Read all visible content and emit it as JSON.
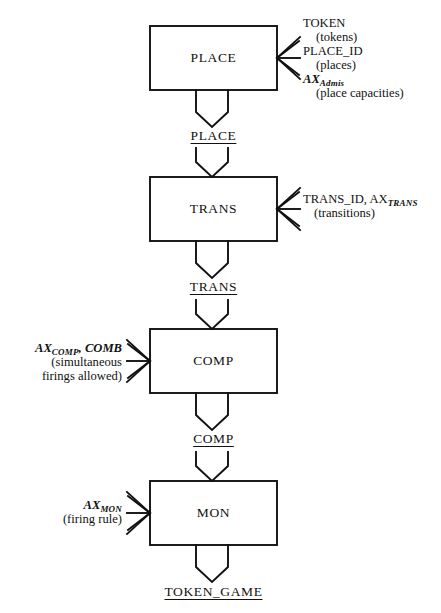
{
  "diagram": {
    "line_color": "#111111",
    "background_color": "#ffffff",
    "stages": [
      {
        "id": "place",
        "box_label": "PLACE",
        "flow_label": "PLACE",
        "side": "right",
        "annotations": [
          {
            "main": "TOKEN",
            "sub": "",
            "paren": "(tokens)"
          },
          {
            "main": "PLACE_ID",
            "sub": "",
            "paren": "(places)"
          },
          {
            "main": "AX",
            "sub": "Admis",
            "paren": "(place capacities)"
          }
        ]
      },
      {
        "id": "trans",
        "box_label": "TRANS",
        "flow_label": "TRANS",
        "side": "right",
        "annotations": [
          {
            "main": "TRANS_ID, AX",
            "sub": "TRANS",
            "paren": "(transitions)"
          }
        ]
      },
      {
        "id": "comp",
        "box_label": "COMP",
        "flow_label": "COMP",
        "side": "left",
        "annotations": [
          {
            "main": "AX",
            "sub": "COMP",
            "main2": ", COMB",
            "paren": "(simultaneous",
            "paren2": "firings allowed)"
          }
        ]
      },
      {
        "id": "mon",
        "box_label": "MON",
        "flow_label": "TOKEN_GAME",
        "side": "left",
        "annotations": [
          {
            "main": "AX",
            "sub": "MON",
            "paren": "(firing rule)"
          }
        ]
      }
    ]
  }
}
